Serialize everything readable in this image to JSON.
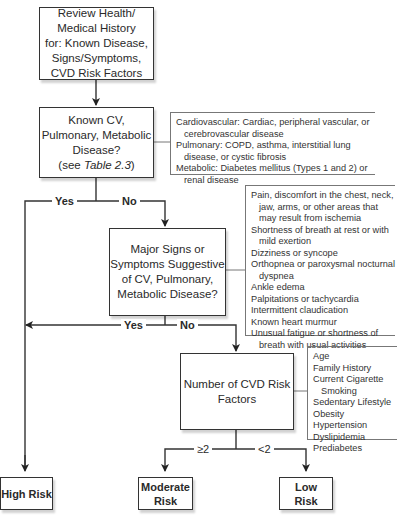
{
  "nodes": {
    "review": {
      "lines": [
        "Review Health/",
        "Medical History",
        "for: Known Disease,",
        "Signs/Symptoms,",
        "CVD Risk Factors"
      ]
    },
    "known_disease": {
      "lines": [
        "Known CV,",
        "Pulmonary, Metabolic",
        "Disease?"
      ],
      "ref_prefix": "(see ",
      "ref_italic": "Table 2.3",
      "ref_suffix": ")"
    },
    "signs_symptoms": {
      "lines": [
        "Major Signs or",
        "Symptoms Suggestive",
        "of CV, Pulmonary,",
        "Metabolic Disease?"
      ]
    },
    "risk_factors": {
      "lines": [
        "Number of CVD Risk",
        "Factors"
      ]
    },
    "high_risk": {
      "lines": [
        "High Risk"
      ]
    },
    "moderate_risk": {
      "lines": [
        "Moderate",
        "Risk"
      ]
    },
    "low_risk": {
      "lines": [
        "Low",
        "Risk"
      ]
    }
  },
  "edge_labels": {
    "yes1": "Yes",
    "no1": "No",
    "yes2": "Yes",
    "no2": "No",
    "ge2": "≥2",
    "lt2": "<2"
  },
  "notes": {
    "diseases": [
      "Cardiovascular: Cardiac, peripheral vascular, or cerebrovascular disease",
      "Pulmonary: COPD, asthma, interstitial lung disease, or cystic fibrosis",
      "Metabolic: Diabetes mellitus (Types 1 and 2) or renal disease"
    ],
    "symptoms": [
      "Pain, discomfort in the chest, neck, jaw, arms, or other areas that may result from ischemia",
      "Shortness of breath at rest or with mild exertion",
      "Dizziness or syncope",
      "Orthopnea or paroxysmal nocturnal dyspnea",
      "Ankle edema",
      "Palpitations or tachycardia",
      "Intermittent claudication",
      "Known heart murmur",
      "Unusual fatigue or shortness of breath with usual activities"
    ],
    "risk_factors": [
      "Age",
      "Family History",
      "Current Cigarette Smoking",
      "Sedentary Lifestyle",
      "Obesity",
      "Hypertension",
      "Dyslipidemia",
      "Prediabetes"
    ]
  }
}
